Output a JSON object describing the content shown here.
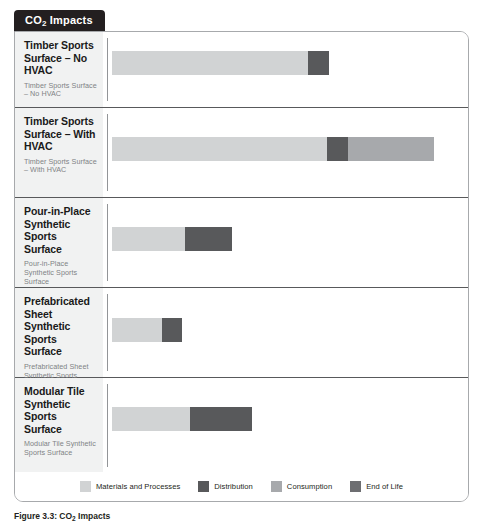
{
  "tab": {
    "label_prefix": "CO",
    "label_sub": "2",
    "label_suffix": " Impacts"
  },
  "caption": {
    "prefix": "Figure 3.3: CO",
    "sub": "2",
    "suffix": " Impacts"
  },
  "legend": {
    "items": [
      {
        "label": "Materials and Processes",
        "color": "#d1d3d4"
      },
      {
        "label": "Distribution",
        "color": "#58595b"
      },
      {
        "label": "Consumption",
        "color": "#a7a9ac"
      },
      {
        "label": "End of Life",
        "color": "#6d6e71"
      }
    ]
  },
  "chart_data": {
    "type": "bar",
    "orientation": "horizontal",
    "stacked": true,
    "title": "CO2 Impacts",
    "xlabel": "",
    "ylabel": "",
    "grid": false,
    "legend_position": "bottom",
    "series": [
      {
        "name": "Materials and Processes",
        "color": "#d1d3d4"
      },
      {
        "name": "Distribution",
        "color": "#58595b"
      },
      {
        "name": "Consumption",
        "color": "#a7a9ac"
      },
      {
        "name": "End of Life",
        "color": "#6d6e71"
      }
    ],
    "categories": [
      "Timber Sports Surface – No HVAC",
      "Timber Sports Surface – With HVAC",
      "Pour-in-Place Synthetic Sports Surface",
      "Prefabricated Sheet Synthetic Sports Surface",
      "Modular Tile Synthetic Sports Surface"
    ],
    "values": [
      [
        196,
        21,
        0,
        0
      ],
      [
        215,
        21,
        86,
        0
      ],
      [
        73,
        47,
        0,
        0
      ],
      [
        50,
        20,
        0,
        0
      ],
      [
        78,
        62,
        0,
        0
      ]
    ]
  },
  "rows": [
    {
      "title": "Timber Sports Surface – No HVAC",
      "subtitle": "Timber Sports Surface – No HVAC",
      "segments": [
        {
          "name": "Materials and Processes",
          "width": 196,
          "color": "#d1d3d4"
        },
        {
          "name": "Distribution",
          "width": 21,
          "color": "#58595b"
        }
      ]
    },
    {
      "title": "Timber Sports Surface – With HVAC",
      "subtitle": "Timber Sports Surface – With HVAC",
      "segments": [
        {
          "name": "Materials and Processes",
          "width": 215,
          "color": "#d1d3d4"
        },
        {
          "name": "Distribution",
          "width": 21,
          "color": "#58595b"
        },
        {
          "name": "Consumption",
          "width": 86,
          "color": "#a7a9ac"
        }
      ]
    },
    {
      "title": "Pour-in-Place Synthetic Sports Surface",
      "subtitle": "Pour-in-Place Synthetic Sports Surface",
      "segments": [
        {
          "name": "Materials and Processes",
          "width": 73,
          "color": "#d1d3d4"
        },
        {
          "name": "Distribution",
          "width": 47,
          "color": "#58595b"
        }
      ]
    },
    {
      "title": "Prefabricated Sheet Synthetic Sports Surface",
      "subtitle": "Prefabricated Sheet Synthetic Sports Surface",
      "segments": [
        {
          "name": "Materials and Processes",
          "width": 50,
          "color": "#d1d3d4"
        },
        {
          "name": "Distribution",
          "width": 20,
          "color": "#58595b"
        }
      ]
    },
    {
      "title": "Modular Tile Synthetic Sports Surface",
      "subtitle": "Modular Tile Synthetic Sports Surface",
      "segments": [
        {
          "name": "Materials and Processes",
          "width": 78,
          "color": "#d1d3d4"
        },
        {
          "name": "Distribution",
          "width": 62,
          "color": "#58595b"
        }
      ]
    }
  ],
  "layout": {
    "row_tops": [
      0,
      76,
      166,
      256,
      346
    ],
    "row_heights": [
      76,
      90,
      90,
      90,
      96
    ],
    "bar_tops": [
      19,
      29,
      29,
      30,
      29
    ],
    "bar_left": 9
  }
}
